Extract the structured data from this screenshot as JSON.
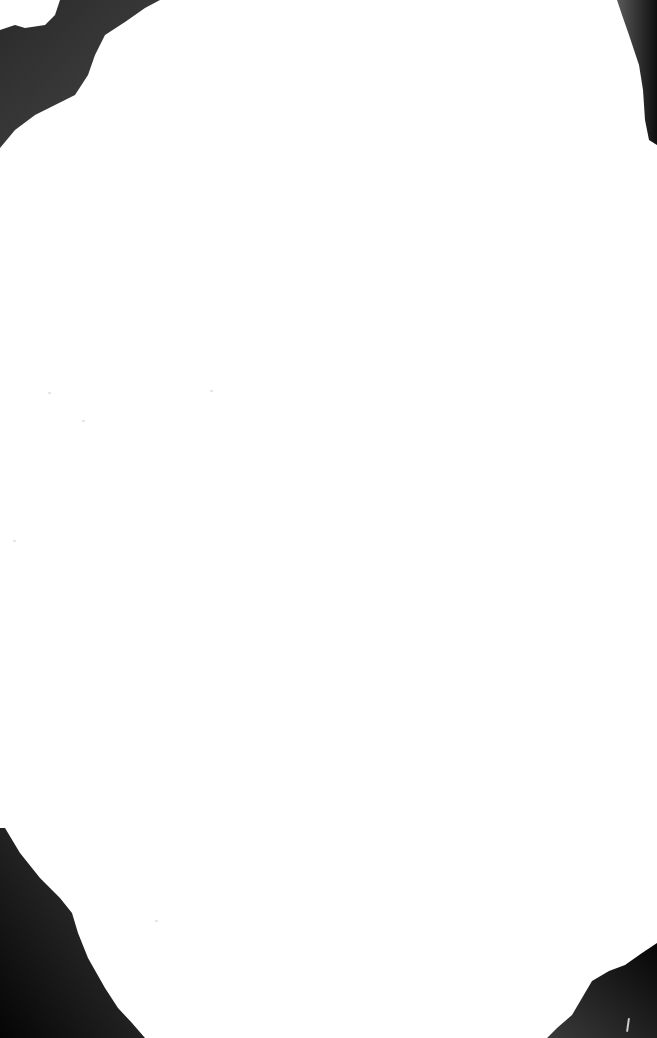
{
  "document": {
    "type": "blank-scanned-page",
    "text_content": "",
    "background_color": "#ffffff"
  },
  "vignette": {
    "shadow_color": "#111111",
    "mid_color": "#6a6a6a",
    "corners": [
      "top-left",
      "top-right",
      "bottom-left",
      "bottom-right"
    ]
  }
}
